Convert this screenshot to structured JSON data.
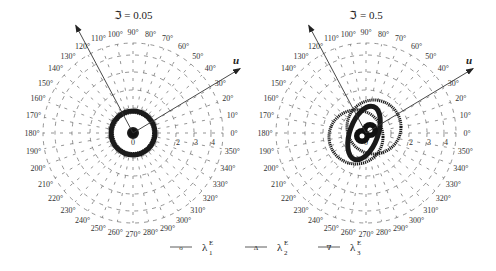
{
  "chart_data": [
    {
      "type": "polar",
      "title": "ℑ = 0.05",
      "center": [
        133,
        133
      ],
      "ring_radii": [
        25,
        43,
        61,
        78,
        90
      ],
      "radial_tick_labels": [
        "0",
        "2",
        "3",
        "4"
      ],
      "angle_labels": [
        "0°",
        "10°",
        "20°",
        "30°",
        "40°",
        "50°",
        "60°",
        "70°",
        "80°",
        "90°",
        "100°",
        "110°",
        "120°",
        "130°",
        "140°",
        "150°",
        "160°",
        "170°",
        "180°",
        "190°",
        "200°",
        "210°",
        "220°",
        "230°",
        "240°",
        "250°",
        "260°",
        "270°",
        "280°",
        "290°",
        "300°",
        "310°",
        "320°",
        "330°",
        "340°",
        "350°"
      ],
      "axis_arrows": [
        {
          "name": "u",
          "angle_deg": 31,
          "length": 125
        },
        {
          "name": "",
          "angle_deg": 118,
          "length": 122
        }
      ],
      "curves": [
        {
          "series": "λ1E",
          "shape": "circle",
          "rx": 22,
          "ry": 22,
          "cx_off": 0,
          "cy_off": 0,
          "rotate": 0,
          "stroke": 5
        },
        {
          "series": "λ2E",
          "shape": "circle",
          "rx": 20,
          "ry": 20,
          "cx_off": 0,
          "cy_off": 0,
          "rotate": 0,
          "stroke": 2
        },
        {
          "series": "λ3E",
          "shape": "circle",
          "rx": 4,
          "ry": 4,
          "cx_off": 0,
          "cy_off": 0,
          "rotate": 0,
          "stroke": 4
        }
      ],
      "grid": true
    },
    {
      "type": "polar",
      "title": "ℑ = 0.5",
      "center": [
        366,
        133
      ],
      "ring_radii": [
        25,
        43,
        61,
        78,
        90
      ],
      "radial_tick_labels": [
        "0",
        "2",
        "3",
        "4"
      ],
      "angle_labels": [
        "0°",
        "10°",
        "20°",
        "30°",
        "40°",
        "50°",
        "60°",
        "70°",
        "80°",
        "90°",
        "100°",
        "110°",
        "120°",
        "130°",
        "140°",
        "150°",
        "160°",
        "170°",
        "180°",
        "190°",
        "200°",
        "210°",
        "220°",
        "230°",
        "240°",
        "250°",
        "260°",
        "270°",
        "280°",
        "290°",
        "300°",
        "310°",
        "320°",
        "330°",
        "340°",
        "350°"
      ],
      "axis_arrows": [
        {
          "name": "u",
          "angle_deg": 31,
          "length": 125
        },
        {
          "name": "",
          "angle_deg": 118,
          "length": 122
        }
      ],
      "curves": [
        {
          "series": "λ1E",
          "shape": "ellipse",
          "rx": 14,
          "ry": 28,
          "cx_off": -2,
          "cy_off": 0,
          "rotate": 20,
          "stroke": 5
        },
        {
          "series": "λ2E",
          "shape": "circle",
          "rx": 27,
          "ry": 27,
          "cx_off": 8,
          "cy_off": -6,
          "rotate": 0,
          "stroke": 3
        },
        {
          "series": "λ3E",
          "shape": "circle",
          "rx": 27,
          "ry": 27,
          "cx_off": -10,
          "cy_off": 4,
          "rotate": 0,
          "stroke": 3
        }
      ],
      "grid": true
    }
  ],
  "legend": {
    "items": [
      {
        "marker": "o",
        "label": "λ",
        "sup": "E",
        "sub": "1"
      },
      {
        "marker": "Δ",
        "label": "λ",
        "sup": "E",
        "sub": "2"
      },
      {
        "marker": "∇",
        "label": "λ",
        "sup": "E",
        "sub": "3"
      }
    ]
  }
}
